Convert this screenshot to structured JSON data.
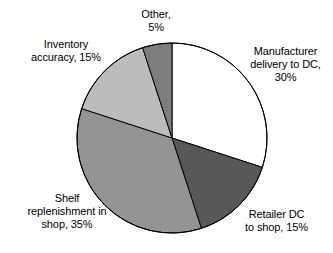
{
  "chart_data": {
    "type": "pie",
    "title": "",
    "subtitle": "",
    "xlabel": "",
    "ylabel": "",
    "legend_position": "none",
    "grid": false,
    "start_angle_deg": 0,
    "direction": "clockwise",
    "categories": [
      "Manufacturer delivery to DC",
      "Retailer DC to shop",
      "Shelf replenishment in shop",
      "Inventory accuracy",
      "Other"
    ],
    "values": [
      30,
      15,
      35,
      15,
      5
    ],
    "unit": "%",
    "total": 100,
    "slices": [
      {
        "key": "manufacturer",
        "name": "Manufacturer delivery to DC",
        "value": 30,
        "value_text": "30%",
        "color": "#ffffff",
        "stroke": "#000000",
        "label_lines": [
          "Manufacturer",
          "delivery to DC,",
          "30%"
        ],
        "label_align": "center"
      },
      {
        "key": "retailer",
        "name": "Retailer DC to shop",
        "value": 15,
        "value_text": "15%",
        "color": "#585858",
        "stroke": "#000000",
        "label_lines": [
          "Retailer DC",
          "to shop, 15%"
        ],
        "label_align": "center"
      },
      {
        "key": "shelf",
        "name": "Shelf replenishment in shop",
        "value": 35,
        "value_text": "35%",
        "color": "#949494",
        "stroke": "#000000",
        "label_lines": [
          "Shelf",
          "replenishment in",
          "shop, 35%"
        ],
        "label_align": "center"
      },
      {
        "key": "inventory",
        "name": "Inventory accuracy",
        "value": 15,
        "value_text": "15%",
        "color": "#bcbcbc",
        "stroke": "#000000",
        "label_lines": [
          "Inventory",
          "accuracy, 15%"
        ],
        "label_align": "center"
      },
      {
        "key": "other",
        "name": "Other",
        "value": 5,
        "value_text": "5%",
        "color": "#7d7d7d",
        "stroke": "#000000",
        "label_lines": [
          "Other,",
          "5%"
        ],
        "label_align": "center"
      }
    ],
    "geometry": {
      "center_x": 172,
      "center_y": 138,
      "radius": 95
    },
    "background_color": "#ffffff",
    "text_color": "#000000"
  },
  "labels": {
    "manufacturer": "Manufacturer\ndelivery to DC,\n30%",
    "retailer": "Retailer DC\nto shop, 15%",
    "shelf": "Shelf\nreplenishment in\nshop, 35%",
    "inventory": "Inventory\naccuracy, 15%",
    "other": "Other,\n5%"
  }
}
